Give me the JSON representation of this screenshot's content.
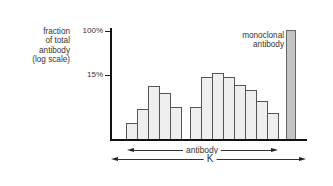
{
  "chart_data": {
    "type": "bar",
    "title": "",
    "ylabel": "fraction of total antibody (log scale)",
    "xlabel": "",
    "y_scale": "log",
    "y_ticks": [
      "100%",
      "15%"
    ],
    "categories": [
      "1",
      "2",
      "3",
      "4",
      "5",
      "6",
      "7",
      "8",
      "9",
      "10",
      "11",
      "12",
      "13",
      "monoclonal"
    ],
    "series": [
      {
        "name": "polyclonal antibody distribution (relative bar height, px above baseline)",
        "values": [
          16,
          30,
          53,
          46,
          32,
          null,
          32,
          62,
          66,
          62,
          54,
          49,
          38,
          26
        ]
      }
    ],
    "bars": [
      {
        "x": 126,
        "w": 11,
        "top": 123
      },
      {
        "x": 137,
        "w": 11,
        "top": 109
      },
      {
        "x": 148,
        "w": 11,
        "top": 86
      },
      {
        "x": 159,
        "w": 11,
        "top": 93
      },
      {
        "x": 170,
        "w": 11,
        "top": 107
      },
      {
        "x": 190,
        "w": 11,
        "top": 107
      },
      {
        "x": 201,
        "w": 11,
        "top": 77
      },
      {
        "x": 212,
        "w": 11,
        "top": 73
      },
      {
        "x": 223,
        "w": 11,
        "top": 77
      },
      {
        "x": 234,
        "w": 11,
        "top": 85
      },
      {
        "x": 245,
        "w": 11,
        "top": 90
      },
      {
        "x": 256,
        "w": 11,
        "top": 101
      },
      {
        "x": 267,
        "w": 11,
        "top": 113
      }
    ],
    "monoclonal_bar": {
      "x": 286,
      "w": 10,
      "top": 30,
      "value": "100%"
    },
    "annotations": [
      "monoclonal antibody",
      "antibody",
      "K"
    ],
    "grid": false,
    "legend": "none"
  },
  "labels": {
    "ylabel_lines": [
      "fraction",
      "of total",
      "antibody",
      "(log scale)"
    ],
    "tick_100": "100%",
    "tick_15": "15%",
    "mono_lines": [
      "monoclonal",
      "antibody"
    ],
    "antibody_arrow": "antibody",
    "k_arrow": "K"
  }
}
